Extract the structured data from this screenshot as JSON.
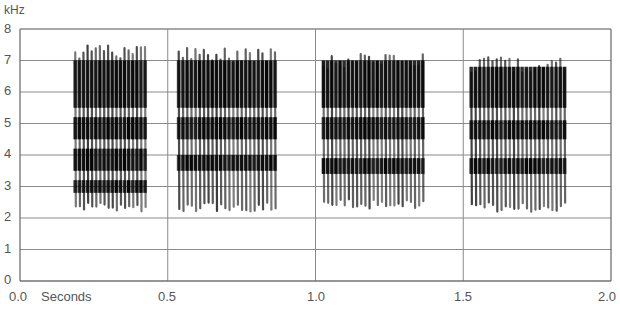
{
  "chart_data": {
    "type": "heatmap",
    "subtype": "spectrogram",
    "title": "",
    "xlabel": "Seconds",
    "ylabel": "kHz",
    "xlim": [
      0.0,
      2.0
    ],
    "ylim": [
      0,
      8
    ],
    "x_ticks": [
      "0.0",
      "0.5",
      "1.0",
      "1.5",
      "2.0"
    ],
    "y_ticks": [
      "0",
      "1",
      "2",
      "3",
      "4",
      "5",
      "6",
      "7",
      "8"
    ],
    "grid": true,
    "syllables": [
      {
        "start_s": 0.18,
        "end_s": 0.43,
        "min_khz": 2.2,
        "max_khz": 7.5,
        "dense_bands_khz": [
          [
            5.5,
            7.0
          ],
          [
            4.5,
            5.2
          ],
          [
            3.5,
            4.2
          ],
          [
            2.8,
            3.2
          ]
        ]
      },
      {
        "start_s": 0.53,
        "end_s": 0.87,
        "min_khz": 2.2,
        "max_khz": 7.4,
        "dense_bands_khz": [
          [
            5.5,
            7.0
          ],
          [
            4.5,
            5.2
          ],
          [
            3.5,
            4.0
          ]
        ]
      },
      {
        "start_s": 1.02,
        "end_s": 1.37,
        "min_khz": 2.3,
        "max_khz": 7.2,
        "dense_bands_khz": [
          [
            5.5,
            7.0
          ],
          [
            4.5,
            5.2
          ],
          [
            3.4,
            3.9
          ]
        ]
      },
      {
        "start_s": 1.52,
        "end_s": 1.85,
        "min_khz": 2.2,
        "max_khz": 7.1,
        "dense_bands_khz": [
          [
            5.5,
            6.8
          ],
          [
            4.5,
            5.1
          ],
          [
            3.4,
            3.9
          ]
        ]
      }
    ]
  },
  "axes": {
    "unit_label": "kHz",
    "x_title": "Seconds",
    "y_labels": [
      "8",
      "7",
      "6",
      "5",
      "4",
      "3",
      "2",
      "1",
      "0"
    ],
    "x_labels": [
      "0.0",
      "0.5",
      "1.0",
      "1.5",
      "2.0"
    ]
  }
}
